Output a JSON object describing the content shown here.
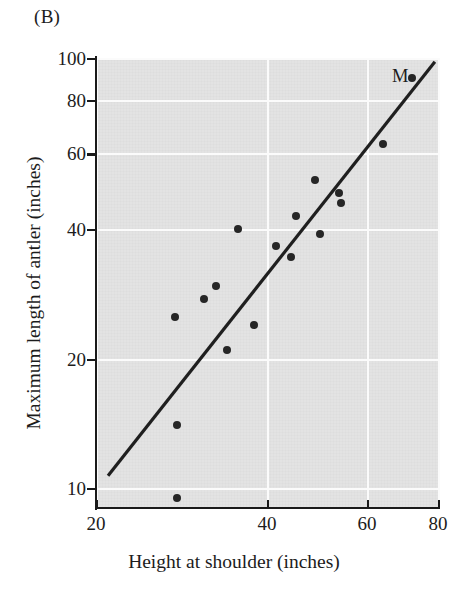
{
  "figure": {
    "panel_label": "(B)",
    "background_color": "#e3e3e3",
    "point_color": "#262626",
    "line_color": "#1f1f1f"
  },
  "chart_data": {
    "type": "scatter",
    "title": "",
    "subtitle": "",
    "xlabel": "Height at shoulder (inches)",
    "ylabel": "Maximum length of antler (inches)",
    "xscale": "log",
    "yscale": "log",
    "xlim": [
      20,
      80
    ],
    "ylim": [
      9,
      100
    ],
    "grid": true,
    "grid_style": "white lines at major ticks",
    "legend": null,
    "xticks": [
      20,
      40,
      60,
      80
    ],
    "xticklabels": [
      "20",
      "40",
      "60",
      "80"
    ],
    "yticks": [
      10,
      20,
      40,
      60,
      80,
      100
    ],
    "yticklabels": [
      "10",
      "20",
      "40",
      "60",
      "80",
      "100"
    ],
    "series": [
      {
        "name": "Deer species",
        "marker": "filled circle",
        "points": [
          {
            "x": 27.5,
            "y": 25.0
          },
          {
            "x": 27.8,
            "y": 14.0
          },
          {
            "x": 27.8,
            "y": 9.5
          },
          {
            "x": 31.0,
            "y": 27.5
          },
          {
            "x": 32.5,
            "y": 29.5
          },
          {
            "x": 34.0,
            "y": 21.0
          },
          {
            "x": 35.5,
            "y": 40.0
          },
          {
            "x": 38.0,
            "y": 24.0
          },
          {
            "x": 41.5,
            "y": 36.5
          },
          {
            "x": 44.0,
            "y": 34.5
          },
          {
            "x": 45.0,
            "y": 43.0
          },
          {
            "x": 48.5,
            "y": 52.0
          },
          {
            "x": 49.5,
            "y": 39.0
          },
          {
            "x": 53.5,
            "y": 48.5
          },
          {
            "x": 54.0,
            "y": 46.0
          },
          {
            "x": 64.0,
            "y": 63.0
          },
          {
            "x": 72.0,
            "y": 90.0
          }
        ]
      }
    ],
    "fit_line": {
      "name": "regression line",
      "x_start": 21.0,
      "y_start": 10.7,
      "x_end": 79.0,
      "y_end": 98.0
    },
    "annotations": [
      {
        "label": "M",
        "x": 68.0,
        "y": 90.0,
        "note": "label for the Irish elk (Megaloceros) data point"
      }
    ]
  }
}
